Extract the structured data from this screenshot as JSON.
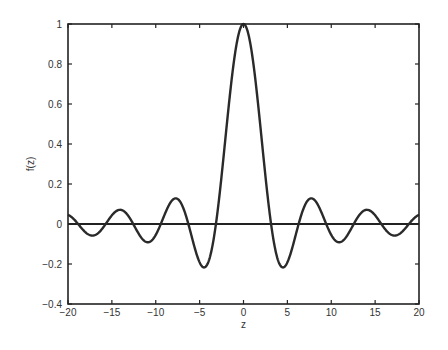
{
  "chart_data": {
    "type": "line",
    "title": "",
    "xlabel": "z",
    "ylabel": "f(z)",
    "xlim": [
      -20,
      20
    ],
    "ylim": [
      -0.4,
      1
    ],
    "xticks": [
      -20,
      -15,
      -10,
      -5,
      0,
      5,
      10,
      15,
      20
    ],
    "xtick_labels": [
      "-20",
      "-15",
      "-10",
      "-5",
      "0",
      "5",
      "10",
      "15",
      "20"
    ],
    "yticks": [
      -0.4,
      -0.2,
      0,
      0.2,
      0.4,
      0.6,
      0.8,
      1
    ],
    "ytick_labels": [
      "-0.4",
      "-0.2",
      "0",
      "0.2",
      "0.4",
      "0.6",
      "0.8",
      "1"
    ],
    "grid": false,
    "legend": null,
    "reference_lines": [
      {
        "axis": "y",
        "value": 0
      }
    ],
    "series": [
      {
        "name": "f(z) = sin(z)/z",
        "x": [
          -20,
          -17.2,
          -14.07,
          -10.9,
          -7.73,
          -4.49,
          -3.14,
          0,
          3.14,
          4.49,
          7.73,
          10.9,
          14.07,
          17.2,
          20
        ],
        "y": [
          0.046,
          -0.058,
          0.071,
          -0.091,
          0.128,
          -0.217,
          0,
          1,
          0,
          -0.217,
          0.128,
          -0.091,
          0.071,
          -0.058,
          0.046
        ]
      }
    ]
  }
}
